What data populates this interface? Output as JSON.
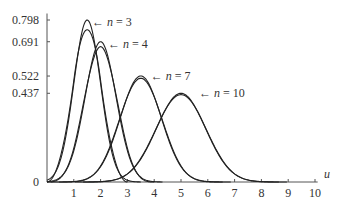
{
  "chart_data": {
    "type": "line",
    "title": "",
    "xlabel": "u",
    "ylabel": "",
    "xlim": [
      0,
      10
    ],
    "ylim": [
      0,
      0.8
    ],
    "grid": false,
    "x_ticks": [
      "1",
      "2",
      "3",
      "4",
      "5",
      "6",
      "7",
      "8",
      "9",
      "10"
    ],
    "y_ticks": [
      {
        "value": 0,
        "label": "0"
      },
      {
        "value": 0.437,
        "label": "0.437"
      },
      {
        "value": 0.522,
        "label": "0.522"
      },
      {
        "value": 0.691,
        "label": "0.691"
      },
      {
        "value": 0.798,
        "label": "0.798"
      }
    ],
    "series": [
      {
        "name": "n=3 (exact)",
        "n": 3,
        "kind": "sum-of-uniforms"
      },
      {
        "name": "n=3 (normal)",
        "n": 3,
        "kind": "normal",
        "mean": 1.5,
        "variance": 0.25,
        "peak": 0.798
      },
      {
        "name": "n=4 (exact)",
        "n": 4,
        "kind": "sum-of-uniforms"
      },
      {
        "name": "n=4 (normal)",
        "n": 4,
        "kind": "normal",
        "mean": 2.0,
        "variance": 0.3333,
        "peak": 0.691
      },
      {
        "name": "n=7 (exact)",
        "n": 7,
        "kind": "sum-of-uniforms"
      },
      {
        "name": "n=7 (normal)",
        "n": 7,
        "kind": "normal",
        "mean": 3.5,
        "variance": 0.5833,
        "peak": 0.522
      },
      {
        "name": "n=10 (exact)",
        "n": 10,
        "kind": "sum-of-uniforms"
      },
      {
        "name": "n=10 (normal)",
        "n": 10,
        "kind": "normal",
        "mean": 5.0,
        "variance": 0.8333,
        "peak": 0.437
      }
    ],
    "annotations": [
      {
        "text": "n = 3",
        "arrow": "←",
        "x": 1.6,
        "y": 0.79
      },
      {
        "text": "n = 4",
        "arrow": "←",
        "x": 2.2,
        "y": 0.68
      },
      {
        "text": "n = 7",
        "arrow": "←",
        "x": 3.8,
        "y": 0.52
      },
      {
        "text": "n = 10",
        "arrow": "←",
        "x": 5.6,
        "y": 0.44
      }
    ]
  },
  "labels": {
    "x_axis": "u",
    "zero": "0",
    "ann": [
      {
        "arrow": "←",
        "n": "n",
        "eq": " = 3"
      },
      {
        "arrow": "←",
        "n": "n",
        "eq": " = 4"
      },
      {
        "arrow": "←",
        "n": "n",
        "eq": " = 7"
      },
      {
        "arrow": "←",
        "n": "n",
        "eq": " = 10"
      }
    ]
  }
}
